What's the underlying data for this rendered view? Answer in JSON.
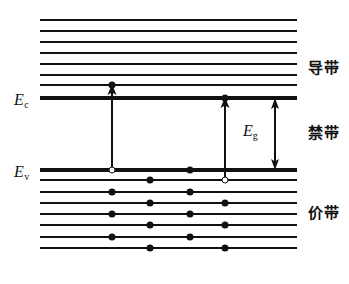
{
  "figure": {
    "width": 349,
    "height": 284,
    "background": "#ffffff",
    "ink_color": "#111111"
  },
  "axis_labels": {
    "conduction_edge": {
      "symbol": "E",
      "subscript": "c",
      "x": 14,
      "y": 92
    },
    "valence_edge": {
      "symbol": "E",
      "subscript": "v",
      "x": 14,
      "y": 164
    }
  },
  "gap_label": {
    "symbol": "E",
    "subscript": "g",
    "x": 243,
    "y": 123
  },
  "band_names": [
    {
      "id": "conduction-band",
      "label": "导带",
      "x": 308,
      "y": 61
    },
    {
      "id": "forbidden-band",
      "label": "禁带",
      "x": 308,
      "y": 126
    },
    {
      "id": "valence-band",
      "label": "价带",
      "x": 308,
      "y": 206
    }
  ],
  "chart_data": {
    "type": "diagram",
    "xlabel": "",
    "ylabel": "能量 E",
    "band_edges": {
      "Ec": 98,
      "Ev": 170
    },
    "band_gap_px": 72,
    "line_x_start": 40,
    "line_x_end": 297,
    "levels": [
      {
        "band": "conduction",
        "index": 0,
        "y": 20,
        "thickness": 2.6,
        "x1": 40,
        "x2": 297
      },
      {
        "band": "conduction",
        "index": 1,
        "y": 31,
        "thickness": 2.6,
        "x1": 40,
        "x2": 297
      },
      {
        "band": "conduction",
        "index": 2,
        "y": 42,
        "thickness": 2.6,
        "x1": 40,
        "x2": 297
      },
      {
        "band": "conduction",
        "index": 3,
        "y": 53,
        "thickness": 2.6,
        "x1": 40,
        "x2": 297
      },
      {
        "band": "conduction",
        "index": 4,
        "y": 64,
        "thickness": 2.6,
        "x1": 40,
        "x2": 297
      },
      {
        "band": "conduction",
        "index": 5,
        "y": 75,
        "thickness": 2.6,
        "x1": 40,
        "x2": 297
      },
      {
        "band": "conduction",
        "index": 6,
        "y": 85,
        "thickness": 2.6,
        "x1": 40,
        "x2": 297
      },
      {
        "band": "conduction",
        "index": 7,
        "y": 98,
        "thickness": 3.2,
        "x1": 40,
        "x2": 297,
        "edge": "Ec"
      },
      {
        "band": "valence",
        "index": 0,
        "y": 170,
        "thickness": 3.2,
        "x1": 40,
        "x2": 297,
        "edge": "Ev"
      },
      {
        "band": "valence",
        "index": 1,
        "y": 180,
        "thickness": 2.6,
        "x1": 40,
        "x2": 297
      },
      {
        "band": "valence",
        "index": 2,
        "y": 192,
        "thickness": 2.6,
        "x1": 40,
        "x2": 297
      },
      {
        "band": "valence",
        "index": 3,
        "y": 203,
        "thickness": 2.6,
        "x1": 40,
        "x2": 297
      },
      {
        "band": "valence",
        "index": 4,
        "y": 214,
        "thickness": 2.6,
        "x1": 40,
        "x2": 297
      },
      {
        "band": "valence",
        "index": 5,
        "y": 225,
        "thickness": 2.6,
        "x1": 40,
        "x2": 297
      },
      {
        "band": "valence",
        "index": 6,
        "y": 237,
        "thickness": 2.6,
        "x1": 40,
        "x2": 297
      },
      {
        "band": "valence",
        "index": 7,
        "y": 248,
        "thickness": 2.6,
        "x1": 40,
        "x2": 297
      }
    ],
    "electrons": [
      {
        "x": 112,
        "y": 85
      },
      {
        "x": 225,
        "y": 98
      },
      {
        "x": 190,
        "y": 170
      },
      {
        "x": 150,
        "y": 180
      },
      {
        "x": 112,
        "y": 192
      },
      {
        "x": 190,
        "y": 192
      },
      {
        "x": 150,
        "y": 203
      },
      {
        "x": 225,
        "y": 203
      },
      {
        "x": 112,
        "y": 214
      },
      {
        "x": 190,
        "y": 214
      },
      {
        "x": 150,
        "y": 225
      },
      {
        "x": 225,
        "y": 225
      },
      {
        "x": 112,
        "y": 237
      },
      {
        "x": 190,
        "y": 237
      },
      {
        "x": 150,
        "y": 248
      },
      {
        "x": 225,
        "y": 248
      }
    ],
    "holes": [
      {
        "x": 112,
        "y": 170
      },
      {
        "x": 225,
        "y": 180
      }
    ],
    "transitions": [
      {
        "id": "left-transition",
        "x": 112,
        "y_from": 170,
        "y_to": 85,
        "direction": "up"
      },
      {
        "id": "right-transition",
        "x": 225,
        "y_from": 180,
        "y_to": 98,
        "direction": "up"
      }
    ],
    "gap_arrow": {
      "x": 275,
      "y_top": 98,
      "y_bottom": 170,
      "direction": "double"
    },
    "legend": [
      {
        "marker": "filled-circle",
        "meaning": "电子 (electron)"
      },
      {
        "marker": "open-circle",
        "meaning": "空穴 (hole)"
      }
    ]
  }
}
